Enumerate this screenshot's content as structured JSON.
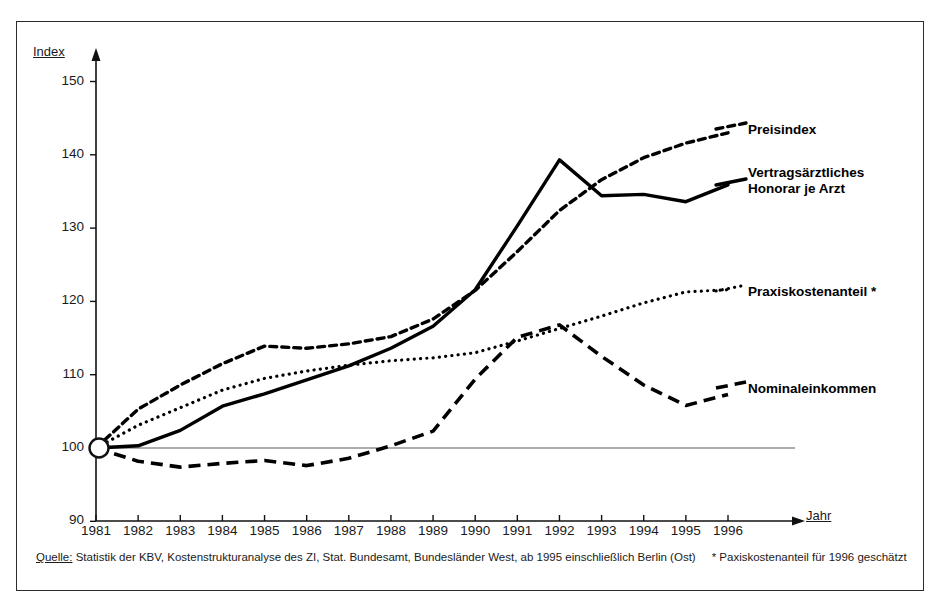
{
  "axes": {
    "y_title": "Index",
    "x_title": "Jahr",
    "y_ticks": [
      "150",
      "140",
      "130",
      "120",
      "110",
      "100",
      "90"
    ],
    "x_ticks": [
      "1981",
      "1982",
      "1983",
      "1984",
      "1985",
      "1986",
      "1987",
      "1988",
      "1989",
      "1990",
      "1991",
      "1992",
      "1993",
      "1994",
      "1995",
      "1996"
    ]
  },
  "series_labels": {
    "preisindex": "Preisindex",
    "honorar_line1": "Vertragsärztliches",
    "honorar_line2": "Honorar je Arzt",
    "honorar": "Vertragsärztliches\nHonorar je Arzt",
    "praxiskostenanteil": "Praxiskostenanteil *",
    "nominaleinkommen": "Nominaleinkommen"
  },
  "source": {
    "prefix": "Quelle:",
    "text": " Statistik der KBV, Kostenstrukturanalyse des ZI, Stat. Bundesamt, Bundesländer West, ab 1995 einschließlich Berlin (Ost)",
    "footnote": "* Paxiskostenanteil für 1996 geschätzt"
  },
  "colors": {
    "ink": "#000000",
    "frame": "#2b2b2b",
    "baseline": "#5a5a5a",
    "background": "#ffffff"
  },
  "chart_data": {
    "type": "line",
    "title": "",
    "xlabel": "Jahr",
    "ylabel": "Index",
    "xlim": [
      1981,
      1996
    ],
    "ylim": [
      90,
      150
    ],
    "grid": false,
    "legend_position": "right-inline",
    "baseline_value": 100,
    "x": [
      1981,
      1982,
      1983,
      1984,
      1985,
      1986,
      1987,
      1988,
      1989,
      1990,
      1991,
      1992,
      1993,
      1994,
      1995,
      1996
    ],
    "series": [
      {
        "name": "Preisindex",
        "style": "dash-dot",
        "values": [
          100.0,
          105.3,
          108.6,
          111.5,
          113.9,
          113.6,
          114.2,
          115.2,
          117.6,
          121.5,
          126.8,
          132.4,
          136.6,
          139.6,
          141.6,
          143.0
        ]
      },
      {
        "name": "Vertragsärztliches Honorar je Arzt",
        "style": "solid",
        "values": [
          100.0,
          100.3,
          102.4,
          105.7,
          107.4,
          109.3,
          111.2,
          113.6,
          116.6,
          121.6,
          130.3,
          139.3,
          134.4,
          134.6,
          133.6,
          135.9
        ]
      },
      {
        "name": "Praxiskostenanteil *",
        "style": "dotted",
        "values": [
          100.0,
          103.1,
          105.5,
          107.9,
          109.5,
          110.5,
          111.3,
          111.9,
          112.3,
          113.0,
          114.6,
          116.3,
          118.0,
          119.8,
          121.3,
          121.6
        ],
        "note": "1996 geschätzt"
      },
      {
        "name": "Nominaleinkommen",
        "style": "dashed",
        "values": [
          100.0,
          98.2,
          97.4,
          97.9,
          98.3,
          97.6,
          98.6,
          100.3,
          102.3,
          109.4,
          115.1,
          116.8,
          112.5,
          108.6,
          105.8,
          107.3
        ]
      }
    ]
  }
}
